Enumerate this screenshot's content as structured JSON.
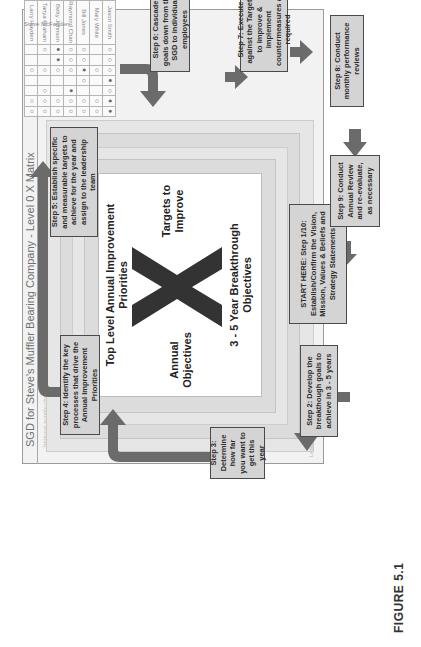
{
  "figure": {
    "label": "FIGURE 5.1"
  },
  "matrix": {
    "title": "SGD for Steve's Muffler Bearing Company - Level 0 X Matrix",
    "center": {
      "mark": "X",
      "top": "Top Level Annual Improvement Priorities",
      "left": "Annual Objectives",
      "right": "Targets to Improve",
      "bottom": "3 - 5 Year Breakthrough Objectives"
    },
    "faint_rows_top": [
      "Improve supply chain effectiveness",
      "Implement Hoshin Kanri planning",
      "Improve quality of product",
      "Reduce inventory",
      "Reduce cycle times"
    ],
    "faint_rows_right": [
      "Current risk assessment",
      "Leadership development",
      "Improve customer service",
      "Reduce defects",
      "Increase market share"
    ],
    "faint_side_left": "Achieve Gold Standard",
    "faint_bottom_label": "Leadership Plan",
    "owner_header": "Steve McFadden",
    "people": [
      "Larry Hayden",
      "Tanya Graham",
      "Betty Johnson",
      "Raymond Chan",
      "Bill Jones",
      "Mary White",
      "Jason Smith"
    ],
    "grid_symbols": [
      [
        "○",
        "○",
        "",
        "",
        "○",
        "",
        ""
      ],
      [
        "○",
        "○",
        "○",
        "",
        "○",
        "",
        "○"
      ],
      [
        "○",
        "○",
        "",
        "",
        "○",
        "●",
        "●"
      ],
      [
        "○",
        "○",
        "●",
        "",
        "○",
        "○",
        "○"
      ],
      [
        "○",
        "○",
        "",
        "○",
        "●",
        "○",
        "○"
      ],
      [
        "○",
        "○",
        "",
        "",
        "○",
        "",
        ""
      ],
      [
        "●",
        "●",
        "○",
        "●",
        "○",
        "○",
        "○"
      ]
    ]
  },
  "steps": {
    "start": "START HERE: Step 1/10: Establish/Confirm the Vision, Mission, Values & Beliefs and Strategy Statements",
    "step2": "Step 2: Develop the breakthough goals to achieve in 3 - 5 years",
    "step3": "Step 3: Determine how far you want to get this year",
    "step4": "Step 4: Identify the key processes that drive the Annual Improvement Priorities",
    "step5": "Step 5: Establish specific and measurable targets to achieve for the year and assign to the leadership team",
    "step6": "Step 6: Cascade goals down from the SGD to individual employees",
    "step7": "Step 7: Execute against the Targets to Improve & implement countermeasures as required",
    "step8": "Step 8: Conduct monthly performance reviews",
    "step9": "Step 9: Conduct Annual Review and re-evaluate, as necessary"
  },
  "colors": {
    "arrow": "#6b6b6b",
    "step_fill": "#d4d4d4",
    "step_border": "#4a4a4a",
    "band_fill": "#dcdcdc",
    "x_mark": "#333333"
  }
}
